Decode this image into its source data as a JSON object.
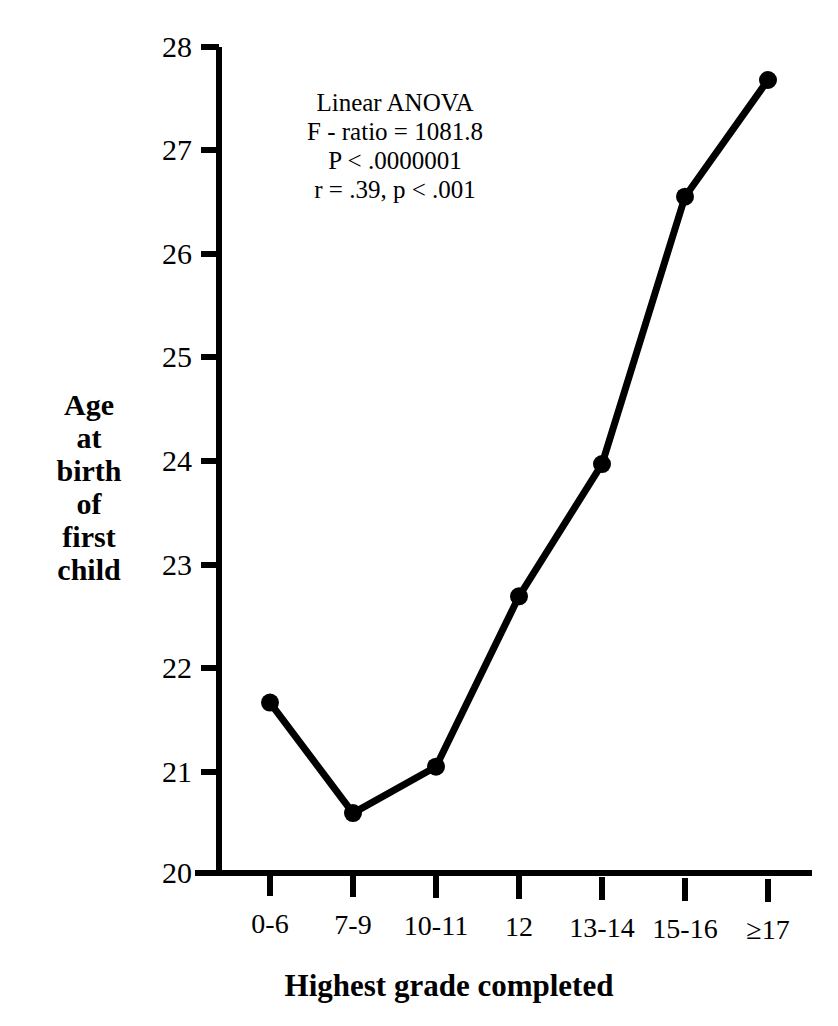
{
  "chart_data": {
    "type": "line",
    "title": "",
    "xlabel": "Highest grade completed",
    "ylabel": "Age at birth of first child",
    "ylabel_lines": [
      "Age",
      "at",
      "birth",
      "of",
      "first",
      "child"
    ],
    "categories": [
      "0-6",
      "7-9",
      "10-11",
      "12",
      "13-14",
      "15-16",
      "≥17"
    ],
    "values": [
      21.65,
      20.58,
      21.03,
      22.68,
      23.96,
      26.55,
      27.68
    ],
    "series": [
      {
        "name": "Age at birth of first child",
        "values": [
          21.65,
          20.58,
          21.03,
          22.68,
          23.96,
          26.55,
          27.68
        ]
      }
    ],
    "ylim": [
      20,
      28
    ],
    "yticks": [
      20,
      21,
      22,
      23,
      24,
      25,
      26,
      27,
      28
    ],
    "ytick_labels": [
      "20",
      "21",
      "22",
      "23",
      "24",
      "25",
      "26",
      "27",
      "28"
    ],
    "xlim": [
      0,
      6
    ],
    "grid": false,
    "legend": "none",
    "marker": "circle",
    "line_color": "#000000",
    "marker_color": "#000000",
    "background_color": "#ffffff",
    "annotations": [
      "Linear ANOVA",
      "F - ratio = 1081.8",
      "P < .0000001",
      "r = .39, p < .001"
    ]
  },
  "annotation": {
    "line1": "Linear ANOVA",
    "line2": "F - ratio = 1081.8",
    "line3": "P < .0000001",
    "line4": "r = .39, p < .001"
  },
  "axes": {
    "y_title_lines": {
      "l0": "Age",
      "l1": "at",
      "l2": "birth",
      "l3": "of",
      "l4": "first",
      "l5": "child"
    },
    "x_title": "Highest grade completed"
  }
}
